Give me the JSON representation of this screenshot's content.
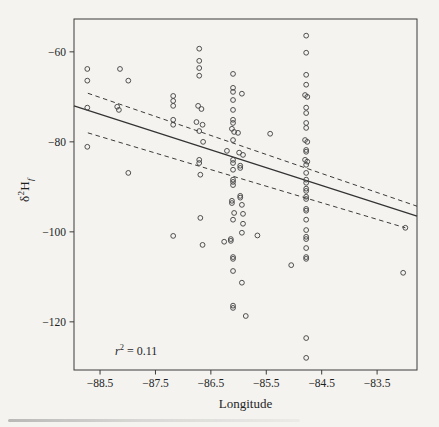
{
  "chart_data": {
    "type": "scatter",
    "title": "",
    "xlabel": "Longitude",
    "ylabel": "δ²Hf",
    "ylabel_parts": {
      "delta": "δ",
      "sup": "2",
      "main": "H",
      "sub": "f"
    },
    "annotation": {
      "var": "r",
      "sup": "2",
      "eq": " = 0.11",
      "x": -88.0,
      "y": -126
    },
    "xlim": [
      -88.97,
      -82.78
    ],
    "ylim": [
      -130.7,
      -52.7
    ],
    "x_ticks": [
      -88.5,
      -87.5,
      -86.5,
      -85.5,
      -84.5,
      -83.5
    ],
    "x_tick_labels": [
      "−88.5",
      "−87.5",
      "−86.5",
      "−85.5",
      "−84.5",
      "−83.5"
    ],
    "y_ticks": [
      -60,
      -80,
      -100,
      -120
    ],
    "y_tick_labels": [
      "−60",
      "−80",
      "−100",
      "−120"
    ],
    "grid": false,
    "legend": null,
    "marker": {
      "shape": "open-circle",
      "radius": 2.4,
      "color": "#474747"
    },
    "regression_line": {
      "style": "solid",
      "points": [
        [
          -88.97,
          -72.0
        ],
        [
          -82.78,
          -96.5
        ]
      ]
    },
    "ci_upper": {
      "style": "dashed",
      "points": [
        [
          -88.72,
          -69.2
        ],
        [
          -82.78,
          -94.3
        ]
      ]
    },
    "ci_lower": {
      "style": "dashed",
      "points": [
        [
          -88.72,
          -78.0
        ],
        [
          -82.99,
          -99.1
        ]
      ]
    },
    "points": [
      [
        -88.73,
        -63.8
      ],
      [
        -88.73,
        -66.4
      ],
      [
        -88.73,
        -72.4
      ],
      [
        -88.73,
        -81.1
      ],
      [
        -88.14,
        -63.8
      ],
      [
        -87.99,
        -66.4
      ],
      [
        -88.19,
        -72.2
      ],
      [
        -88.16,
        -72.9
      ],
      [
        -87.99,
        -86.9
      ],
      [
        -87.18,
        -69.8
      ],
      [
        -87.18,
        -70.9
      ],
      [
        -87.18,
        -72.0
      ],
      [
        -87.18,
        -75.1
      ],
      [
        -87.18,
        -76.2
      ],
      [
        -87.18,
        -100.9
      ],
      [
        -86.71,
        -59.3
      ],
      [
        -86.71,
        -62.0
      ],
      [
        -86.71,
        -63.6
      ],
      [
        -86.71,
        -65.3
      ],
      [
        -86.73,
        -72.0
      ],
      [
        -86.67,
        -72.7
      ],
      [
        -86.76,
        -75.6
      ],
      [
        -86.65,
        -76.2
      ],
      [
        -86.71,
        -77.6
      ],
      [
        -86.64,
        -80.0
      ],
      [
        -86.71,
        -84.0
      ],
      [
        -86.71,
        -84.7
      ],
      [
        -86.69,
        -87.3
      ],
      [
        -86.69,
        -96.9
      ],
      [
        -86.65,
        -102.9
      ],
      [
        -86.1,
        -64.9
      ],
      [
        -86.1,
        -68.0
      ],
      [
        -86.1,
        -68.9
      ],
      [
        -85.94,
        -69.3
      ],
      [
        -86.1,
        -70.7
      ],
      [
        -86.1,
        -72.9
      ],
      [
        -86.1,
        -75.1
      ],
      [
        -86.1,
        -75.8
      ],
      [
        -86.12,
        -77.1
      ],
      [
        -86.08,
        -77.8
      ],
      [
        -86.01,
        -78.0
      ],
      [
        -86.1,
        -79.6
      ],
      [
        -86.21,
        -82.0
      ],
      [
        -85.99,
        -82.4
      ],
      [
        -85.92,
        -82.9
      ],
      [
        -86.1,
        -84.0
      ],
      [
        -86.1,
        -84.7
      ],
      [
        -85.97,
        -85.3
      ],
      [
        -85.97,
        -85.8
      ],
      [
        -86.1,
        -86.2
      ],
      [
        -86.1,
        -88.4
      ],
      [
        -86.1,
        -88.9
      ],
      [
        -86.1,
        -89.6
      ],
      [
        -85.97,
        -92.0
      ],
      [
        -85.97,
        -92.4
      ],
      [
        -86.12,
        -93.1
      ],
      [
        -86.12,
        -93.6
      ],
      [
        -85.94,
        -94.0
      ],
      [
        -86.08,
        -95.8
      ],
      [
        -85.92,
        -96.0
      ],
      [
        -86.1,
        -97.3
      ],
      [
        -85.92,
        -98.2
      ],
      [
        -85.94,
        -100.2
      ],
      [
        -86.14,
        -101.6
      ],
      [
        -86.14,
        -102.0
      ],
      [
        -86.26,
        -102.2
      ],
      [
        -86.1,
        -105.6
      ],
      [
        -86.1,
        -106.0
      ],
      [
        -86.1,
        -108.7
      ],
      [
        -85.94,
        -111.3
      ],
      [
        -86.1,
        -116.4
      ],
      [
        -86.1,
        -116.9
      ],
      [
        -85.87,
        -118.7
      ],
      [
        -85.43,
        -78.2
      ],
      [
        -85.66,
        -100.8
      ],
      [
        -85.05,
        -107.4
      ],
      [
        -84.78,
        -56.4
      ],
      [
        -84.78,
        -60.2
      ],
      [
        -84.78,
        -65.1
      ],
      [
        -84.78,
        -67.3
      ],
      [
        -84.8,
        -69.6
      ],
      [
        -84.76,
        -70.0
      ],
      [
        -84.78,
        -72.4
      ],
      [
        -84.78,
        -73.6
      ],
      [
        -84.78,
        -75.8
      ],
      [
        -84.78,
        -76.9
      ],
      [
        -84.8,
        -79.6
      ],
      [
        -84.76,
        -80.0
      ],
      [
        -84.78,
        -81.8
      ],
      [
        -84.78,
        -82.2
      ],
      [
        -84.8,
        -84.0
      ],
      [
        -84.76,
        -84.4
      ],
      [
        -84.78,
        -85.1
      ],
      [
        -84.78,
        -86.9
      ],
      [
        -84.78,
        -88.4
      ],
      [
        -84.78,
        -89.1
      ],
      [
        -84.78,
        -90.4
      ],
      [
        -84.78,
        -90.9
      ],
      [
        -84.78,
        -92.2
      ],
      [
        -84.78,
        -92.7
      ],
      [
        -84.78,
        -94.9
      ],
      [
        -84.78,
        -95.3
      ],
      [
        -84.78,
        -97.3
      ],
      [
        -84.78,
        -99.6
      ],
      [
        -84.78,
        -101.1
      ],
      [
        -84.78,
        -101.6
      ],
      [
        -84.78,
        -103.6
      ],
      [
        -84.78,
        -105.6
      ],
      [
        -84.78,
        -106.0
      ],
      [
        -84.78,
        -123.6
      ],
      [
        -84.78,
        -128.0
      ],
      [
        -82.99,
        -99.1
      ],
      [
        -83.03,
        -109.1
      ]
    ],
    "colors": {
      "background": "#f4f3f0",
      "frame": "#3b3b3b",
      "marker": "#474747",
      "line": "#333333",
      "ci_line": "#3b3b3b",
      "text": "#1f1f1f"
    }
  }
}
